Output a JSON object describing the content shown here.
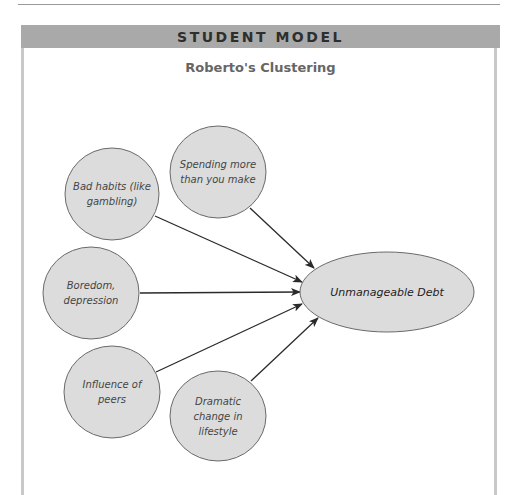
{
  "header": {
    "band_label": "STUDENT MODEL",
    "title": "Roberto's Clustering"
  },
  "colors": {
    "header_band": "#a9a9a9",
    "node_fill": "#dcdcdc",
    "node_stroke": "#6a6a6a",
    "arrow": "#2a2a2a",
    "box_border": "#c8c8c8"
  },
  "diagram": {
    "central_node": {
      "label": "Unmanageable Debt",
      "cx": 387,
      "cy": 292,
      "rx": 87,
      "ry": 40
    },
    "cause_nodes": [
      {
        "id": "bad-habits",
        "lines": [
          "Bad habits (like",
          "gambling)"
        ],
        "cx": 112,
        "cy": 194,
        "rx": 47,
        "ry": 46,
        "arrow_from": [
          155,
          216
        ],
        "arrow_to": [
          302,
          282
        ]
      },
      {
        "id": "spending",
        "lines": [
          "Spending more",
          "than you make"
        ],
        "cx": 218,
        "cy": 172,
        "rx": 48,
        "ry": 46,
        "arrow_from": [
          250,
          208
        ],
        "arrow_to": [
          314,
          268
        ]
      },
      {
        "id": "boredom",
        "lines": [
          "Boredom,",
          "depression"
        ],
        "cx": 91,
        "cy": 293,
        "rx": 48,
        "ry": 46,
        "arrow_from": [
          140,
          293
        ],
        "arrow_to": [
          300,
          292
        ]
      },
      {
        "id": "peers",
        "lines": [
          "Influence of",
          "peers"
        ],
        "cx": 112,
        "cy": 392,
        "rx": 48,
        "ry": 46,
        "arrow_from": [
          156,
          372
        ],
        "arrow_to": [
          302,
          304
        ]
      },
      {
        "id": "lifestyle",
        "lines": [
          "Dramatic",
          "change in",
          "lifestyle"
        ],
        "cx": 218,
        "cy": 416,
        "rx": 48,
        "ry": 45,
        "arrow_from": [
          251,
          381
        ],
        "arrow_to": [
          318,
          318
        ]
      }
    ]
  }
}
